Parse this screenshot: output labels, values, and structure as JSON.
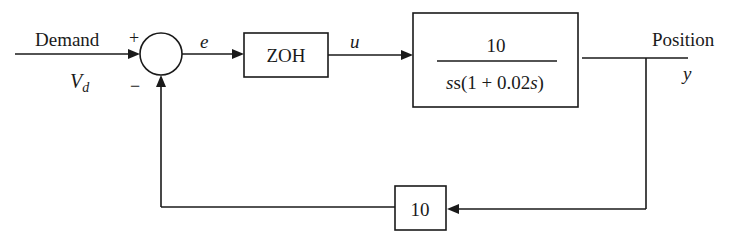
{
  "diagram": {
    "type": "block-diagram",
    "input": {
      "label": "Demand",
      "symbol": "V",
      "symbol_subscript": "d"
    },
    "summing_junction": {
      "plus_sign": "+",
      "minus_sign": "−"
    },
    "signals": {
      "error": "e",
      "control": "u",
      "output_symbol": "y"
    },
    "blocks": {
      "zoh": {
        "label": "ZOH"
      },
      "plant": {
        "numerator": "10",
        "denominator_prefix": "s(1 + 0.02",
        "denominator_var": "s",
        "denominator_suffix": ")"
      },
      "feedback": {
        "label": "10"
      }
    },
    "output": {
      "label": "Position"
    },
    "colors": {
      "stroke": "#1a1a1a",
      "background": "#ffffff"
    }
  }
}
